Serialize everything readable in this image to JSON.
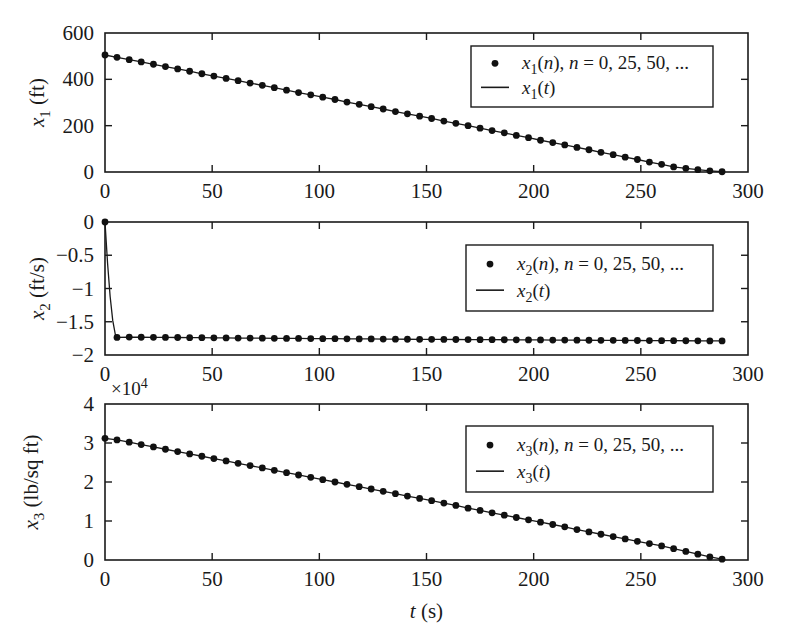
{
  "figure": {
    "name": "three-stacked-time-series-subplots",
    "background_color": "#ffffff",
    "line_color": "#1a1a1a",
    "marker_color": "#111111",
    "xlabel": "t (s)",
    "xlabel_italic_part": "t",
    "xlabel_unit_part": " (s)"
  },
  "chart_data": [
    {
      "type": "line",
      "name": "x1-altitude-subplot",
      "title": "",
      "xlabel": "",
      "ylabel": "x_1 (ft)",
      "ylabel_symbol": "x",
      "ylabel_subscript": "1",
      "ylabel_unit": "(ft)",
      "xlim": [
        0,
        300
      ],
      "ylim": [
        0,
        600
      ],
      "xticks": [
        0,
        50,
        100,
        150,
        200,
        250,
        300
      ],
      "xticklabels": [
        "0",
        "50",
        "100",
        "150",
        "200",
        "250",
        "300"
      ],
      "yticks": [
        0,
        200,
        400,
        600
      ],
      "yticklabels": [
        "0",
        "200",
        "400",
        "600"
      ],
      "grid": false,
      "multiplier": "",
      "legend_position": "upper right",
      "legend": [
        {
          "marker": "dot",
          "label": "x_1(n), n = 0, 25, 50, ..."
        },
        {
          "marker": "line",
          "label": "x_1(t)"
        }
      ],
      "x": [
        0,
        5.6,
        11.3,
        16.9,
        22.6,
        28.2,
        33.9,
        39.5,
        45.2,
        50.8,
        56.5,
        62.1,
        67.7,
        73.4,
        79.0,
        84.7,
        90.3,
        96.0,
        101.6,
        107.3,
        112.9,
        118.6,
        124.2,
        129.8,
        135.5,
        141.1,
        146.8,
        152.4,
        158.1,
        163.7,
        169.4,
        175.0,
        180.6,
        186.3,
        191.9,
        197.6,
        203.2,
        208.9,
        214.5,
        220.2,
        225.8,
        231.4,
        237.1,
        242.7,
        248.4,
        254.0,
        259.7,
        265.3,
        271.0,
        276.6,
        282.2,
        287.9
      ],
      "y": [
        505,
        495,
        485,
        475,
        465,
        455,
        445,
        435,
        424,
        414,
        404,
        394,
        384,
        374,
        364,
        353,
        343,
        333,
        323,
        313,
        302,
        292,
        282,
        272,
        261,
        251,
        241,
        231,
        220,
        210,
        200,
        189,
        179,
        169,
        158,
        148,
        137,
        127,
        117,
        106,
        96,
        85,
        75,
        64,
        54,
        43,
        33,
        22,
        16,
        10,
        5,
        1
      ],
      "series": [
        {
          "name": "x_1(t)",
          "style": "line"
        },
        {
          "name": "x_1(n), n = 0, 25, 50, ...",
          "style": "markers"
        }
      ]
    },
    {
      "type": "line",
      "name": "x2-velocity-subplot",
      "title": "",
      "xlabel": "",
      "ylabel": "x_2 (ft/s)",
      "ylabel_symbol": "x",
      "ylabel_subscript": "2",
      "ylabel_unit": "(ft/s)",
      "xlim": [
        0,
        300
      ],
      "ylim": [
        -2,
        0
      ],
      "xticks": [
        0,
        50,
        100,
        150,
        200,
        250,
        300
      ],
      "xticklabels": [
        "0",
        "50",
        "100",
        "150",
        "200",
        "250",
        "300"
      ],
      "yticks": [
        -2,
        -1.5,
        -1,
        -0.5,
        0
      ],
      "yticklabels": [
        "-2",
        "-1.5",
        "-1",
        "-0.5",
        "0"
      ],
      "grid": false,
      "multiplier": "",
      "legend_position": "upper right",
      "legend": [
        {
          "marker": "dot",
          "label": "x_2(n), n = 0, 25, 50, ..."
        },
        {
          "marker": "line",
          "label": "x_2(t)"
        }
      ],
      "x": [
        0,
        1.2,
        2.4,
        3.6,
        4.8,
        5.6,
        11.3,
        16.9,
        22.6,
        28.2,
        33.9,
        39.5,
        45.2,
        50.8,
        56.5,
        62.1,
        67.7,
        73.4,
        79.0,
        84.7,
        90.3,
        96.0,
        101.6,
        107.3,
        112.9,
        118.6,
        124.2,
        129.8,
        135.5,
        141.1,
        146.8,
        152.4,
        158.1,
        163.7,
        169.4,
        175.0,
        180.6,
        186.3,
        191.9,
        197.6,
        203.2,
        208.9,
        214.5,
        220.2,
        225.8,
        231.4,
        237.1,
        242.7,
        248.4,
        254.0,
        259.7,
        265.3,
        271.0,
        276.6,
        282.2,
        287.9
      ],
      "y": [
        0,
        -0.62,
        -1.12,
        -1.48,
        -1.69,
        -1.735,
        -1.731,
        -1.733,
        -1.734,
        -1.736,
        -1.737,
        -1.739,
        -1.74,
        -1.742,
        -1.743,
        -1.745,
        -1.746,
        -1.747,
        -1.749,
        -1.75,
        -1.751,
        -1.753,
        -1.754,
        -1.755,
        -1.757,
        -1.758,
        -1.759,
        -1.76,
        -1.762,
        -1.763,
        -1.764,
        -1.765,
        -1.766,
        -1.767,
        -1.768,
        -1.769,
        -1.77,
        -1.771,
        -1.772,
        -1.773,
        -1.774,
        -1.775,
        -1.776,
        -1.777,
        -1.778,
        -1.779,
        -1.78,
        -1.781,
        -1.782,
        -1.783,
        -1.784,
        -1.785,
        -1.786,
        -1.787,
        -1.788,
        -1.789
      ],
      "marker_x": [
        0,
        5.6,
        11.3,
        16.9,
        22.6,
        28.2,
        33.9,
        39.5,
        45.2,
        50.8,
        56.5,
        62.1,
        67.7,
        73.4,
        79.0,
        84.7,
        90.3,
        96.0,
        101.6,
        107.3,
        112.9,
        118.6,
        124.2,
        129.8,
        135.5,
        141.1,
        146.8,
        152.4,
        158.1,
        163.7,
        169.4,
        175.0,
        180.6,
        186.3,
        191.9,
        197.6,
        203.2,
        208.9,
        214.5,
        220.2,
        225.8,
        231.4,
        237.1,
        242.7,
        248.4,
        254.0,
        259.7,
        265.3,
        271.0,
        276.6,
        282.2,
        287.9
      ],
      "marker_y": [
        0,
        -1.735,
        -1.731,
        -1.733,
        -1.734,
        -1.736,
        -1.737,
        -1.739,
        -1.74,
        -1.742,
        -1.743,
        -1.745,
        -1.746,
        -1.747,
        -1.749,
        -1.75,
        -1.751,
        -1.753,
        -1.754,
        -1.755,
        -1.757,
        -1.758,
        -1.759,
        -1.76,
        -1.762,
        -1.763,
        -1.764,
        -1.765,
        -1.766,
        -1.767,
        -1.768,
        -1.769,
        -1.77,
        -1.771,
        -1.772,
        -1.773,
        -1.774,
        -1.775,
        -1.776,
        -1.777,
        -1.778,
        -1.779,
        -1.78,
        -1.781,
        -1.782,
        -1.783,
        -1.784,
        -1.785,
        -1.786,
        -1.787,
        -1.788,
        -1.789
      ],
      "series": [
        {
          "name": "x_2(t)",
          "style": "line"
        },
        {
          "name": "x_2(n), n = 0, 25, 50, ...",
          "style": "markers"
        }
      ]
    },
    {
      "type": "line",
      "name": "x3-pressure-subplot",
      "title": "",
      "xlabel": "t (s)",
      "ylabel": "x_3 (lb/sq ft)",
      "ylabel_symbol": "x",
      "ylabel_subscript": "3",
      "ylabel_unit": "(lb/sq ft)",
      "xlim": [
        0,
        300
      ],
      "ylim": [
        0,
        4
      ],
      "xticks": [
        0,
        50,
        100,
        150,
        200,
        250,
        300
      ],
      "xticklabels": [
        "0",
        "50",
        "100",
        "150",
        "200",
        "250",
        "300"
      ],
      "yticks": [
        0,
        1,
        2,
        3,
        4
      ],
      "yticklabels": [
        "0",
        "1",
        "2",
        "3",
        "4"
      ],
      "grid": false,
      "multiplier": "x10^4",
      "multiplier_base": "10",
      "multiplier_exponent": "4",
      "legend_position": "upper right",
      "legend": [
        {
          "marker": "dot",
          "label": "x_3(n), n = 0, 25, 50, ..."
        },
        {
          "marker": "line",
          "label": "x_3(t)"
        }
      ],
      "x": [
        0,
        5.6,
        11.3,
        16.9,
        22.6,
        28.2,
        33.9,
        39.5,
        45.2,
        50.8,
        56.5,
        62.1,
        67.7,
        73.4,
        79.0,
        84.7,
        90.3,
        96.0,
        101.6,
        107.3,
        112.9,
        118.6,
        124.2,
        129.8,
        135.5,
        141.1,
        146.8,
        152.4,
        158.1,
        163.7,
        169.4,
        175.0,
        180.6,
        186.3,
        191.9,
        197.6,
        203.2,
        208.9,
        214.5,
        220.2,
        225.8,
        231.4,
        237.1,
        242.7,
        248.4,
        254.0,
        259.7,
        265.3,
        271.0,
        276.6,
        282.2,
        287.9
      ],
      "y": [
        3.12,
        3.08,
        3.02,
        2.96,
        2.9,
        2.84,
        2.78,
        2.72,
        2.66,
        2.6,
        2.54,
        2.48,
        2.42,
        2.36,
        2.3,
        2.24,
        2.18,
        2.12,
        2.06,
        2.0,
        1.94,
        1.88,
        1.82,
        1.76,
        1.7,
        1.64,
        1.58,
        1.52,
        1.46,
        1.4,
        1.33,
        1.27,
        1.21,
        1.15,
        1.09,
        1.03,
        0.97,
        0.91,
        0.85,
        0.78,
        0.72,
        0.66,
        0.6,
        0.54,
        0.48,
        0.42,
        0.36,
        0.29,
        0.22,
        0.15,
        0.08,
        0.02
      ],
      "series": [
        {
          "name": "x_3(t)",
          "style": "line"
        },
        {
          "name": "x_3(n), n = 0, 25, 50, ...",
          "style": "markers"
        }
      ]
    }
  ]
}
